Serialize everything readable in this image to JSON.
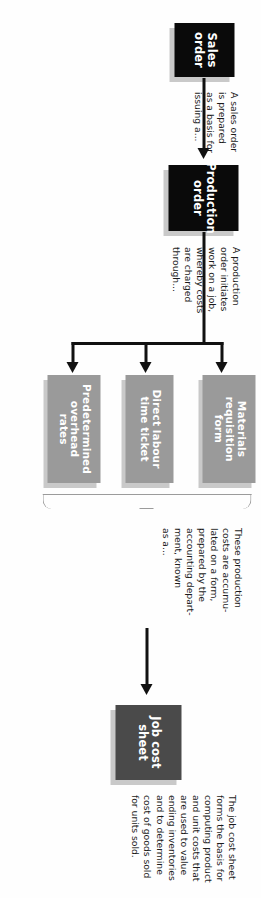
{
  "diagram": {
    "orientation": "rotated-90-clockwise",
    "colors": {
      "black_box": "#0a0a0a",
      "dark_gray_box": "#4a4a4a",
      "mid_gray_box": "#9a9a9a",
      "box_shadow": "#c9c9c9",
      "connector": "#111111",
      "brace": "#9b9b9b",
      "text_on_box": "#ffffff",
      "note_text": "#1b1b1b",
      "background": "#fefefe"
    },
    "nodes": [
      {
        "id": "sales-order",
        "label": "Sales\norder",
        "style": "black"
      },
      {
        "id": "production-order",
        "label": "Production\norder",
        "style": "black"
      },
      {
        "id": "materials-requisition-form",
        "label": "Materials\nrequisition\nform",
        "style": "mid-gray"
      },
      {
        "id": "direct-labour-time-ticket",
        "label": "Direct labour\ntime ticket",
        "style": "mid-gray"
      },
      {
        "id": "predetermined-overhead-rates",
        "label": "Predetermined\noverhead\nrates",
        "style": "mid-gray"
      },
      {
        "id": "job-cost-sheet",
        "label": "Job cost\nsheet",
        "style": "dark-gray"
      }
    ],
    "notes": [
      {
        "id": "note-sales-order",
        "text": "A sales order\nis prepared\nas a basis for\nissuing a..."
      },
      {
        "id": "note-production-order",
        "text": "A production\norder initiates\nwork on a job,\nwhereby costs\nare charged\nthrough..."
      },
      {
        "id": "note-job-cost-sheet-input",
        "text": "These production\ncosts are accumu-\nlated on a form,\nprepared by the\naccounting depart-\nment, known\nas a..."
      },
      {
        "id": "note-job-cost-sheet",
        "text": "The job cost sheet\nforms the basis for\ncomputing product\nand unit costs that\nare used to value\nending inventories\nand to determine\ncost of goods sold\nfor units sold."
      }
    ]
  }
}
